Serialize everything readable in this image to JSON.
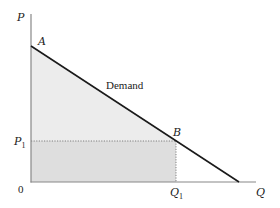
{
  "diagram": {
    "axes": {
      "y_label": "P",
      "x_label": "Q",
      "origin_label": "0"
    },
    "curve": {
      "label": "Demand"
    },
    "points": {
      "A": "A",
      "B": "B"
    },
    "price_marker": {
      "main": "P",
      "sub": "1"
    },
    "quantity_marker": {
      "main": "Q",
      "sub": "1"
    },
    "colors": {
      "axis": "#888888",
      "curve": "#1a1a1a",
      "triangle_fill": "#ececec",
      "rectangle_fill": "#dedede",
      "dotted": "#666666",
      "text": "#222222"
    }
  }
}
